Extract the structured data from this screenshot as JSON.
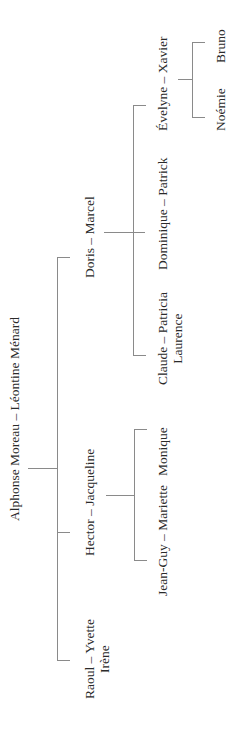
{
  "tree": {
    "root": {
      "label": "Alphonse Moreau – Léontine Ménard"
    },
    "children": [
      {
        "label": "Raoul – Yvette",
        "sub": "Irène"
      },
      {
        "label": "Hector – Jacqueline",
        "children": [
          {
            "label": "Jean-Guy – Mariette"
          },
          {
            "label": "Monique"
          }
        ]
      },
      {
        "label": "Doris – Marcel",
        "children": [
          {
            "label": "Claude – Patricia",
            "sub": "Laurence"
          },
          {
            "label": "Dominique – Patrick"
          },
          {
            "label": "Évelyne – Xavier",
            "children": [
              {
                "label": "Noémie"
              },
              {
                "label": "Bruno"
              }
            ]
          }
        ]
      }
    ]
  },
  "colors": {
    "line": "#8a8a8a",
    "text": "#2a2a2a",
    "background": "#ffffff"
  }
}
